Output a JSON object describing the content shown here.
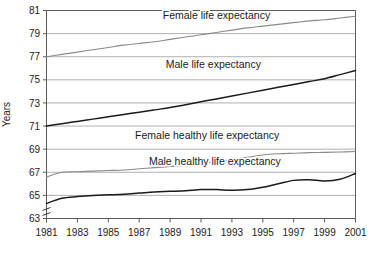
{
  "chart_data": {
    "type": "line",
    "title": "",
    "xlabel": "",
    "ylabel": "Years",
    "xlim": [
      1981,
      2001
    ],
    "ylim": [
      63,
      81
    ],
    "y_axis_break": true,
    "grid": true,
    "legend_position": "inline-labels",
    "xticks": [
      "1981",
      "1983",
      "1985",
      "1987",
      "1989",
      "1991",
      "1993",
      "1995",
      "1997",
      "1999",
      "2001"
    ],
    "yticks": [
      "63",
      "65",
      "67",
      "69",
      "71",
      "73",
      "75",
      "77",
      "79",
      "81"
    ],
    "x": [
      1981,
      1982,
      1983,
      1984,
      1985,
      1986,
      1987,
      1988,
      1989,
      1990,
      1991,
      1992,
      1993,
      1994,
      1995,
      1996,
      1997,
      1998,
      1999,
      2000,
      2001
    ],
    "series": [
      {
        "name": "Female life expectancy",
        "color": "#8a8a8a",
        "width": 1.1,
        "label_x": 1992.0,
        "label_y": 80.3,
        "values": [
          77.0,
          77.2,
          77.4,
          77.6,
          77.8,
          78.0,
          78.15,
          78.3,
          78.5,
          78.7,
          78.9,
          79.1,
          79.3,
          79.5,
          79.65,
          79.8,
          79.95,
          80.1,
          80.2,
          80.35,
          80.5
        ]
      },
      {
        "name": "Male life expectancy",
        "color": "#1a1a1a",
        "width": 1.5,
        "label_x": 1991.8,
        "label_y": 76.0,
        "values": [
          71.0,
          71.2,
          71.4,
          71.6,
          71.8,
          72.0,
          72.2,
          72.4,
          72.6,
          72.85,
          73.1,
          73.35,
          73.6,
          73.85,
          74.1,
          74.35,
          74.6,
          74.85,
          75.1,
          75.45,
          75.8
        ]
      },
      {
        "name": "Female healthy life expectancy",
        "color": "#8a8a8a",
        "width": 1.1,
        "label_x": 1991.4,
        "label_y": 69.9,
        "values": [
          66.6,
          67.0,
          67.05,
          67.1,
          67.15,
          67.2,
          67.3,
          67.4,
          67.5,
          67.6,
          67.75,
          67.9,
          68.1,
          68.3,
          68.5,
          68.6,
          68.65,
          68.7,
          68.72,
          68.75,
          68.8
        ]
      },
      {
        "name": "Male healthy life expectancy",
        "color": "#1a1a1a",
        "width": 1.5,
        "label_x": 1991.9,
        "label_y": 67.6,
        "values": [
          64.3,
          64.75,
          64.9,
          65.0,
          65.05,
          65.1,
          65.2,
          65.3,
          65.35,
          65.4,
          65.5,
          65.5,
          65.45,
          65.5,
          65.7,
          66.0,
          66.3,
          66.35,
          66.25,
          66.4,
          66.9
        ]
      }
    ]
  }
}
